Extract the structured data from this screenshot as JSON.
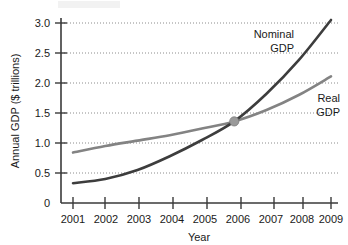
{
  "chart_data": {
    "type": "line",
    "title": "",
    "xlabel": "Year",
    "ylabel": "Annual GDP ($ trillions)",
    "x": [
      2001,
      2002,
      2003,
      2004,
      2005,
      2006,
      2007,
      2008,
      2009
    ],
    "xtick_labels": [
      "2001",
      "2002",
      "2003",
      "2004",
      "2005",
      "2006",
      "2007",
      "2008",
      "2009"
    ],
    "ytick_labels": [
      "0",
      "0.5",
      "1.0",
      "1.5",
      "2.0",
      "2.5",
      "3.0"
    ],
    "ytick_values": [
      0,
      0.5,
      1.0,
      1.5,
      2.0,
      2.5,
      3.0
    ],
    "xlim": [
      2001,
      2009
    ],
    "ylim": [
      0,
      3.15
    ],
    "grid": "horizontal-dotted",
    "legend": "inline-labels",
    "series": [
      {
        "name": "Nominal GDP",
        "color": "#3d3d3d",
        "label_line1": "Nominal",
        "label_line2": "GDP",
        "values": [
          0.33,
          0.4,
          0.55,
          0.78,
          1.05,
          1.36,
          1.82,
          2.38,
          3.05
        ]
      },
      {
        "name": "Real GDP",
        "color": "#838383",
        "label_line1": "Real",
        "label_line2": "GDP",
        "values": [
          0.84,
          0.95,
          1.04,
          1.13,
          1.24,
          1.36,
          1.55,
          1.8,
          2.11
        ]
      }
    ],
    "annotations": [
      {
        "name": "intersection-point",
        "x": 2006,
        "y": 1.36,
        "marker": "filled-circle",
        "color": "#9a9a9a"
      }
    ]
  }
}
